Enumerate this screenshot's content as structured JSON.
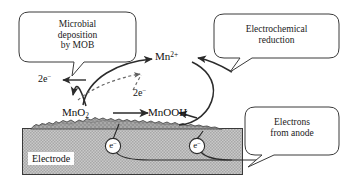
{
  "figure": {
    "callouts": [
      {
        "id": "microbial-deposition",
        "lines": [
          "Microbial",
          "deposition",
          "by MOB"
        ]
      },
      {
        "id": "electrochemical-reduction",
        "lines": [
          "Electrochemical",
          "reduction"
        ]
      },
      {
        "id": "electrons-from-anode",
        "lines": [
          "Electrons",
          "from anode"
        ]
      }
    ],
    "species": {
      "mn_ion": {
        "base": "Mn",
        "charge": "2+"
      },
      "mno2": {
        "base": "MnO",
        "sub": "2"
      },
      "mnooh": {
        "base": "MnOOH"
      },
      "electrons_left": {
        "count": "2e",
        "charge": "−"
      },
      "electrons_dashed": {
        "count": "2e",
        "charge": "−"
      },
      "electron_carrier_1": {
        "base": "e",
        "charge": "−"
      },
      "electron_carrier_2": {
        "base": "e",
        "charge": "−"
      }
    },
    "electrode": {
      "label": "Electrode"
    },
    "colors": {
      "background": "#ffffff",
      "stroke": "#2b2b2b",
      "electrode_fill": "#bdbdbd",
      "deposit_fill": "#9a9a9a",
      "text": "#111111"
    }
  }
}
